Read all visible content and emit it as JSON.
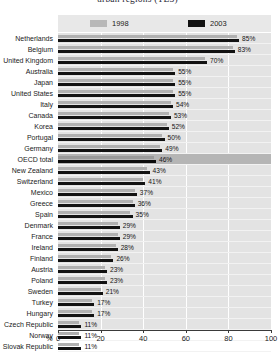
{
  "chart": {
    "title": "urban regions (TL3)",
    "axis_unit": "%"
  },
  "legend": {
    "position": "top",
    "items": [
      {
        "label": "1998",
        "color": "#b0b0b0",
        "name": "legend-1998"
      },
      {
        "label": "2003",
        "color": "#121212",
        "name": "legend-2003"
      }
    ]
  },
  "chart_data": {
    "type": "bar",
    "orientation": "horizontal",
    "title": "urban regions (TL3)",
    "xlabel": "%",
    "ylabel": "",
    "xlim": [
      0,
      100
    ],
    "xticks": [
      0,
      20,
      40,
      60,
      80,
      100
    ],
    "xtick_labels": [
      "0",
      "20",
      "40",
      "60",
      "80",
      "100"
    ],
    "grid": true,
    "legend_position": "top",
    "highlight_category": "OECD total",
    "categories": [
      "Netherlands",
      "Belgium",
      "United Kingdom",
      "Australia",
      "Japan",
      "United States",
      "Italy",
      "Canada",
      "Korea",
      "Portugal",
      "Germany",
      "OECD total",
      "New Zealand",
      "Switzerland",
      "Mexico",
      "Greece",
      "Spain",
      "Denmark",
      "France",
      "Ireland",
      "Finland",
      "Austria",
      "Poland",
      "Sweden",
      "Turkey",
      "Hungary",
      "Czech Republic",
      "Norway",
      "Slovak Republic"
    ],
    "series": [
      {
        "name": "1998",
        "color": "#b0b0b0",
        "values": [
          84,
          82,
          69,
          54,
          54,
          54,
          53,
          52,
          51,
          49,
          48,
          45,
          42,
          40,
          36,
          35,
          34,
          28,
          28,
          27,
          25,
          22,
          22,
          20,
          16,
          16,
          10,
          10,
          10
        ]
      },
      {
        "name": "2003",
        "color": "#121212",
        "values": [
          85,
          83,
          70,
          55,
          55,
          55,
          54,
          53,
          52,
          50,
          49,
          46,
          43,
          41,
          37,
          36,
          35,
          29,
          29,
          28,
          26,
          23,
          23,
          21,
          17,
          17,
          11,
          11,
          11
        ]
      }
    ],
    "data_labels": [
      "85%",
      "83%",
      "70%",
      "55%",
      "55%",
      "55%",
      "54%",
      "53%",
      "52%",
      "50%",
      "49%",
      "46%",
      "43%",
      "41%",
      "37%",
      "36%",
      "35%",
      "29%",
      "29%",
      "28%",
      "26%",
      "23%",
      "23%",
      "21%",
      "17%",
      "17%",
      "11%",
      "11%",
      "11%"
    ]
  }
}
